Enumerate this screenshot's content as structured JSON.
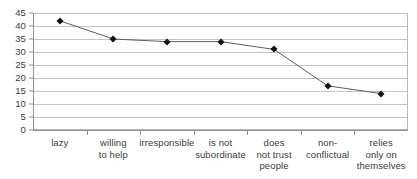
{
  "chart_data": {
    "type": "line",
    "title": "",
    "subtitle": "",
    "xlabel": "",
    "ylabel": "",
    "categories": [
      "lazy",
      "willing\nto help",
      "irresponsible",
      "is not\nsubordinate",
      "does\nnot trust\npeople",
      "non-\nconflictual",
      "relies\nonly on\nthemselves"
    ],
    "values": [
      42,
      35,
      34,
      34,
      31,
      17,
      14
    ],
    "series": [
      {
        "name": "",
        "values": [
          42,
          35,
          34,
          34,
          31,
          17,
          14
        ]
      }
    ],
    "ylim": [
      0,
      45
    ],
    "y_ticks": [
      0,
      5,
      10,
      15,
      20,
      25,
      30,
      35,
      40,
      45
    ],
    "y_tick_labels": [
      "0",
      "5",
      "10",
      "15",
      "20",
      "25",
      "30",
      "35",
      "40",
      "45"
    ],
    "grid": true,
    "grid_axis": "y",
    "legend": false,
    "legend_position": "none",
    "marker": "diamond",
    "annotations": []
  },
  "style": {
    "background_color": "#ffffff",
    "gridline_color": "#c3c3c3",
    "axis_color": "#8f8f8f",
    "line_color": "#5c5c5c",
    "marker_color": "#121212",
    "text_color": "#3b3b3b",
    "plot_border_color": "#b9b9b9"
  }
}
